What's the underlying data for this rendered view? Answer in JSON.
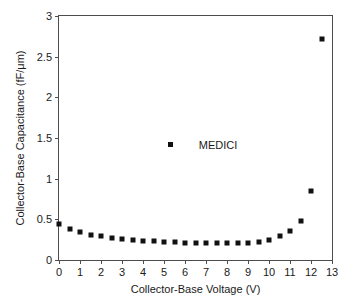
{
  "chart_data": {
    "type": "scatter",
    "title": "",
    "xlabel": "Collector-Base Voltage (V)",
    "ylabel": "Collector-Base Capacitance  (fF/μm)",
    "xlim": [
      0,
      13
    ],
    "ylim": [
      0,
      3
    ],
    "grid": false,
    "legend_position": "center",
    "marker": "filled-square",
    "marker_color": "#111111",
    "xticks": [
      "0",
      "1",
      "2",
      "3",
      "4",
      "5",
      "6",
      "7",
      "8",
      "9",
      "10",
      "11",
      "12",
      "13"
    ],
    "xtick_values": [
      0,
      1,
      2,
      3,
      4,
      5,
      6,
      7,
      8,
      9,
      10,
      11,
      12,
      13
    ],
    "yticks": [
      "0",
      "0.5",
      "1",
      "1.5",
      "2",
      "2.5",
      "3"
    ],
    "ytick_values": [
      0,
      0.5,
      1,
      1.5,
      2,
      2.5,
      3
    ],
    "series": [
      {
        "name": "MEDICI",
        "x": [
          0,
          0.5,
          1,
          1.5,
          2,
          2.5,
          3,
          3.5,
          4,
          4.5,
          5,
          5.5,
          6,
          6.5,
          7,
          7.5,
          8,
          8.5,
          9,
          9.5,
          10,
          10.5,
          11,
          11.5,
          12,
          12.5
        ],
        "y": [
          0.44,
          0.38,
          0.34,
          0.31,
          0.29,
          0.27,
          0.26,
          0.24,
          0.235,
          0.23,
          0.225,
          0.22,
          0.215,
          0.215,
          0.21,
          0.21,
          0.21,
          0.21,
          0.215,
          0.22,
          0.25,
          0.29,
          0.36,
          0.48,
          0.85,
          2.72
        ]
      }
    ],
    "legend": {
      "label": "MEDICI",
      "marker_x": 5.3,
      "marker_y": 1.46
    }
  }
}
